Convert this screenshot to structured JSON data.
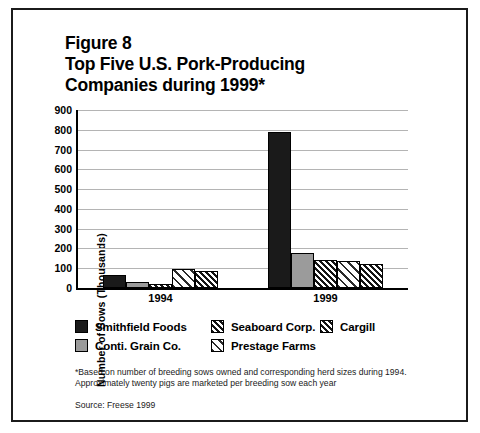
{
  "figure": {
    "title_lines": [
      "Figure 8",
      "Top Five U.S. Pork-Producing",
      "Companies during 1999*"
    ]
  },
  "chart_data": {
    "type": "bar",
    "title": "Top Five U.S. Pork-Producing Companies during 1999*",
    "xlabel": "",
    "ylabel": "Number of Sows (Thousands)",
    "categories": [
      "1994",
      "1999"
    ],
    "ylim": [
      0,
      900
    ],
    "ytick_labels": [
      "0",
      "100",
      "200",
      "300",
      "400",
      "500",
      "600",
      "700",
      "800",
      "900"
    ],
    "yticks": [
      0,
      100,
      200,
      300,
      400,
      500,
      600,
      700,
      800,
      900
    ],
    "grid": true,
    "legend_position": "below-axes",
    "series": [
      {
        "name": "Smithfield Foods",
        "pattern": "solid-black",
        "values": [
          65,
          790
        ]
      },
      {
        "name": "Conti. Grain Co.",
        "pattern": "solid-gray",
        "values": [
          28,
          175
        ]
      },
      {
        "name": "Seaboard Corp.",
        "pattern": "hatch-dark",
        "values": [
          18,
          140
        ]
      },
      {
        "name": "Prestage Farms",
        "pattern": "hatch-light",
        "values": [
          95,
          135
        ]
      },
      {
        "name": "Cargill",
        "pattern": "hatch-dark",
        "values": [
          88,
          120
        ]
      }
    ],
    "annotations": [
      "*Based on number of breeding sows owned and corresponding herd sizes during 1994.",
      "Approximately twenty pigs are marketed per breeding sow each year",
      "Source: Freese 1999"
    ]
  },
  "legend": {
    "entries": [
      {
        "label": "Smithfield Foods"
      },
      {
        "label": "Seaboard Corp."
      },
      {
        "label": "Cargill"
      },
      {
        "label": "Conti. Grain Co."
      },
      {
        "label": "Prestage Farms"
      }
    ]
  },
  "footnotes": {
    "line1": "*Based on number of breeding sows owned and corresponding herd sizes during 1994.",
    "line2": "Approximately twenty pigs are marketed per breeding sow each year",
    "source": "Source: Freese 1999"
  },
  "colors": {
    "ink": "#000000",
    "grid": "#b4b4b4",
    "solid_black": "#1a1a1a",
    "solid_gray": "#9b9b9b",
    "background": "#ffffff"
  }
}
